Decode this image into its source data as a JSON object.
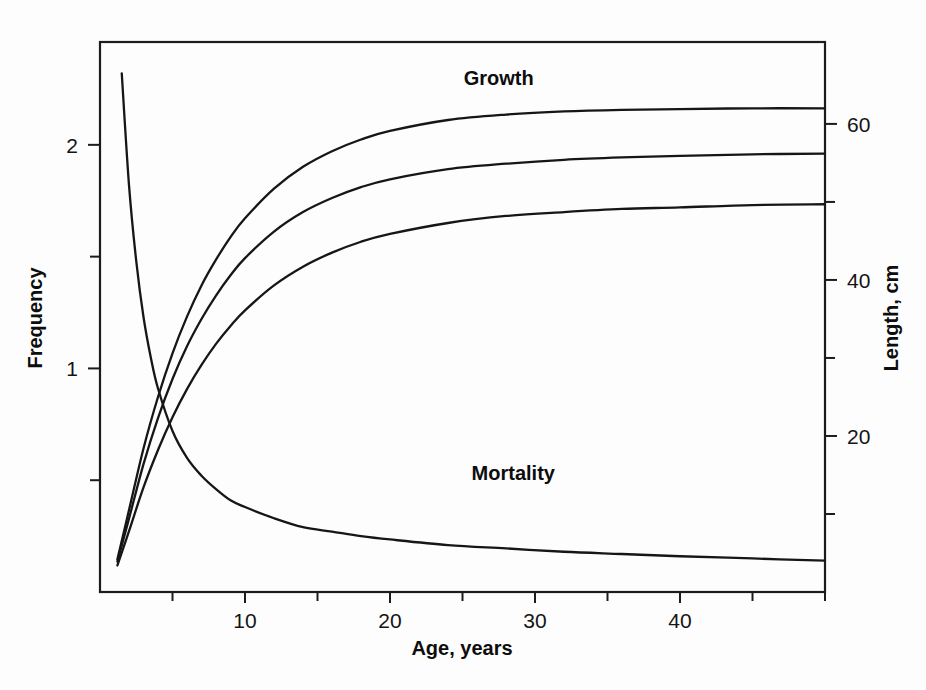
{
  "chart_data": {
    "type": "line",
    "title": "",
    "xlabel": "Age, years",
    "ylabel": "Frequency",
    "y2label": "Length, cm",
    "xlim": [
      0,
      50
    ],
    "ylim": [
      0,
      2.46
    ],
    "y2lim": [
      0,
      70.5
    ],
    "grid": false,
    "legend_position": "inline-annotations",
    "xticks_major": [
      10,
      20,
      30,
      40
    ],
    "xticks_major_labels": [
      "10",
      "20",
      "30",
      "40"
    ],
    "xticks_minor": [
      5,
      15,
      25,
      35,
      45,
      50
    ],
    "yticks_major": [
      1,
      2
    ],
    "yticks_major_labels": [
      "1",
      "2"
    ],
    "yticks_minor": [
      0.5,
      1.5
    ],
    "y2ticks_major": [
      20,
      40,
      60
    ],
    "y2ticks_major_labels": [
      "20",
      "40",
      "60"
    ],
    "y2ticks_minor": [
      10,
      30,
      50
    ],
    "annotations": [
      {
        "text": "Growth",
        "x": 27.5,
        "y_axis": "right",
        "y": 65.0
      },
      {
        "text": "Mortality",
        "x": 28.5,
        "y_axis": "left",
        "y": 0.5
      }
    ],
    "series": [
      {
        "name": "Growth",
        "axis": "right",
        "units": "cm",
        "type": "von-bertalanffy",
        "asymptote": 62.0,
        "x": [
          1.2,
          2,
          3,
          4,
          5,
          6,
          7,
          8,
          9,
          10,
          12,
          14,
          16,
          18,
          20,
          24,
          28,
          32,
          36,
          40,
          45,
          50
        ],
        "values": [
          4.2,
          10.5,
          18.4,
          25.0,
          30.6,
          35.3,
          39.3,
          42.6,
          45.5,
          47.9,
          51.7,
          54.5,
          56.5,
          58.0,
          59.1,
          60.5,
          61.2,
          61.6,
          61.8,
          61.9,
          62.0,
          62.0
        ]
      },
      {
        "name": "Growth",
        "axis": "right",
        "units": "cm",
        "type": "von-bertalanffy",
        "asymptote": 56.5,
        "x": [
          1.2,
          2,
          3,
          4,
          5,
          6,
          7,
          8,
          9,
          10,
          12,
          14,
          16,
          18,
          20,
          24,
          28,
          32,
          36,
          40,
          45,
          50
        ],
        "values": [
          3.9,
          9.4,
          16.4,
          22.3,
          27.3,
          31.5,
          35.0,
          38.0,
          40.6,
          42.8,
          46.2,
          48.7,
          50.5,
          51.9,
          52.9,
          54.2,
          54.9,
          55.4,
          55.7,
          55.9,
          56.1,
          56.2
        ]
      },
      {
        "name": "Growth",
        "axis": "right",
        "units": "cm",
        "type": "von-bertalanffy",
        "asymptote": 51.5,
        "x": [
          1.2,
          2,
          3,
          4,
          5,
          6,
          7,
          8,
          9,
          10,
          12,
          14,
          16,
          18,
          20,
          24,
          28,
          32,
          36,
          40,
          45,
          50
        ],
        "values": [
          3.4,
          7.8,
          13.4,
          18.2,
          22.4,
          26.0,
          29.1,
          31.8,
          34.1,
          36.1,
          39.3,
          41.7,
          43.5,
          44.9,
          45.9,
          47.3,
          48.2,
          48.7,
          49.1,
          49.3,
          49.6,
          49.7
        ]
      },
      {
        "name": "Mortality",
        "axis": "left",
        "units": "",
        "type": "exponential-decay",
        "x": [
          1.5,
          2,
          2.5,
          3,
          3.5,
          4,
          5,
          6,
          7,
          8,
          9,
          10,
          12,
          14,
          16,
          18,
          20,
          24,
          28,
          32,
          36,
          40,
          45,
          50
        ],
        "values": [
          2.32,
          1.82,
          1.48,
          1.23,
          1.05,
          0.91,
          0.72,
          0.6,
          0.52,
          0.46,
          0.41,
          0.38,
          0.33,
          0.29,
          0.27,
          0.25,
          0.235,
          0.21,
          0.195,
          0.18,
          0.17,
          0.16,
          0.15,
          0.14
        ]
      }
    ]
  },
  "colors": {
    "curve": "#161616",
    "axis": "#1c1c1c",
    "background": "#ffffff"
  },
  "labels": {
    "x_axis_title": "Age, years",
    "y_axis_title": "Frequency",
    "y2_axis_title": "Length, cm",
    "growth_annotation": "Growth",
    "mortality_annotation": "Mortality"
  }
}
